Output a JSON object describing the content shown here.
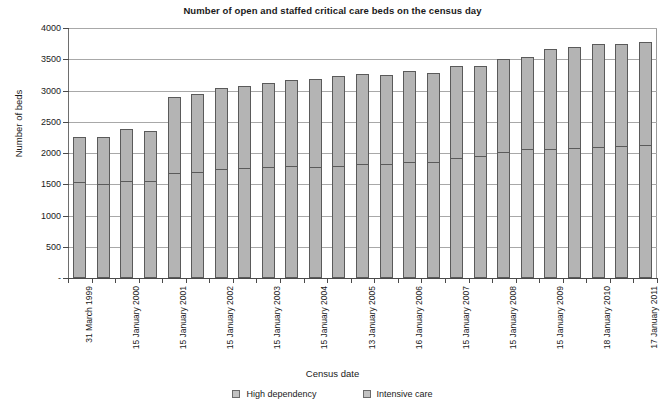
{
  "chart_data": {
    "type": "bar",
    "stacked": true,
    "title": "Number of open and staffed critical care beds on the census day",
    "xlabel": "Census date",
    "ylabel": "Number of beds",
    "ylim": [
      0,
      4000
    ],
    "ytick_values": [
      0,
      500,
      1000,
      1500,
      2000,
      2500,
      3000,
      3500,
      4000
    ],
    "ytick_labels": [
      "-",
      "500",
      "1000",
      "1500",
      "2000",
      "2500",
      "3000",
      "3500",
      "4000"
    ],
    "grid": true,
    "legend_position": "bottom",
    "legend": [
      "High dependency",
      "Intensive care"
    ],
    "categories": [
      "31 March 1999",
      "",
      "15 January 2000",
      "",
      "15 January 2001",
      "",
      "15 January 2002",
      "",
      "15 January 2003",
      "",
      "15 January 2004",
      "",
      "13 January 2005",
      "",
      "16 January 2006",
      "",
      "15 January 2007",
      "",
      "15 January 2008",
      "",
      "15 January 2009",
      "",
      "18 January 2010",
      "",
      "17 January 2011"
    ],
    "tick_labels": [
      "31 March 1999",
      "15 January 2000",
      "15 January 2001",
      "15 January 2002",
      "15 January 2003",
      "15 January 2004",
      "13 January 2005",
      "16 January 2006",
      "15 January 2007",
      "15 January 2008",
      "15 January 2009",
      "18 January 2010",
      "17 January 2011"
    ],
    "series": [
      {
        "name": "Intensive care",
        "values": [
          1530,
          1510,
          1560,
          1560,
          1680,
          1700,
          1740,
          1760,
          1780,
          1790,
          1780,
          1790,
          1830,
          1830,
          1860,
          1860,
          1920,
          1960,
          2010,
          2060,
          2070,
          2080,
          2100,
          2110,
          2130
        ]
      },
      {
        "name": "High dependency",
        "values": [
          730,
          740,
          820,
          800,
          1220,
          1250,
          1300,
          1320,
          1340,
          1380,
          1400,
          1440,
          1430,
          1420,
          1450,
          1420,
          1470,
          1440,
          1490,
          1480,
          1600,
          1620,
          1640,
          1630,
          1650
        ]
      }
    ],
    "totals": [
      2260,
      2250,
      2380,
      2360,
      2900,
      2950,
      3040,
      3080,
      3120,
      3170,
      3180,
      3230,
      3260,
      3250,
      3310,
      3280,
      3390,
      3400,
      3500,
      3540,
      3670,
      3700,
      3740,
      3740,
      3780
    ]
  }
}
